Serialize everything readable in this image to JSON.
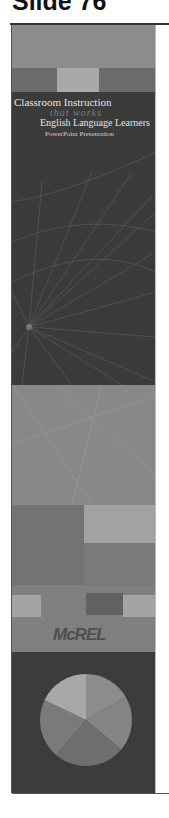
{
  "header": {
    "slide_label": "Slide 76"
  },
  "slide": {
    "title_line1": "Classroom Instruction",
    "title_line2": "that works",
    "title_line3": "English Language Learners",
    "subtitle": "PowerPoint Presentation",
    "logo_text": "McREL"
  },
  "colors": {
    "band_top": "#8c8c8c",
    "band_strip": "#6a6a6a",
    "band_strip_light": "#a8a8a8",
    "dark_panel": "#3b3b3b",
    "mid_panel": "#858585",
    "pie_light": "#a6a6a6",
    "pie_mid": "#8a8a8a",
    "pie_dark": "#6f6f6f"
  }
}
